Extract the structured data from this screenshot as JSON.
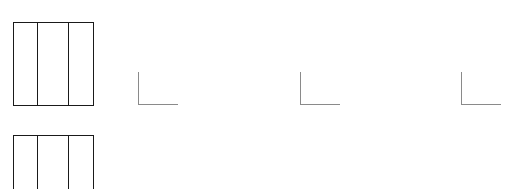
{
  "diagram": {
    "line_color": "#1a1a1a",
    "axis_color": "#8a8a8a",
    "background": "#ffffff",
    "boxes": [
      {
        "id": "top-box",
        "x": 13,
        "y": 22,
        "width": 80,
        "height": 83,
        "columns": 3,
        "divider_x": [
          24,
          55
        ]
      },
      {
        "id": "bottom-box",
        "x": 13,
        "y": 135,
        "width": 80,
        "height": 60,
        "columns": 3,
        "divider_x": [
          24,
          55
        ],
        "clipped_bottom": true
      }
    ],
    "axis_corners": [
      {
        "id": "corner-1",
        "x": 138,
        "y": 72,
        "width": 40,
        "height": 32
      },
      {
        "id": "corner-2",
        "x": 300,
        "y": 72,
        "width": 40,
        "height": 32
      },
      {
        "id": "corner-3",
        "x": 461,
        "y": 72,
        "width": 40,
        "height": 32
      }
    ]
  }
}
